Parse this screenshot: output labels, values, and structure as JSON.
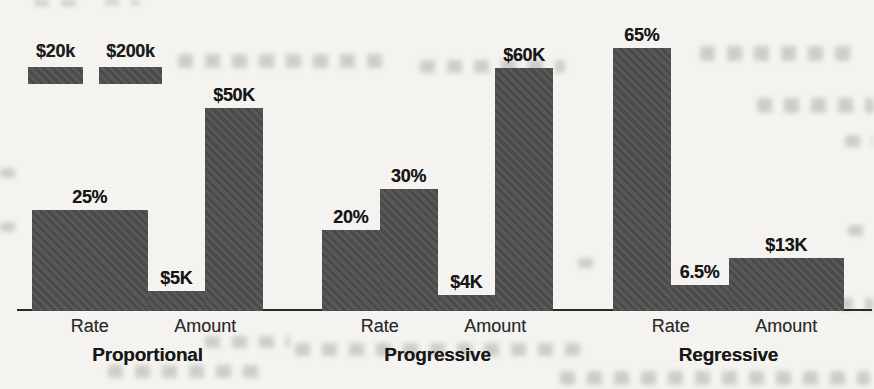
{
  "chart_data": {
    "type": "bar",
    "title": "",
    "xlabel": "",
    "ylabel": "",
    "grid": false,
    "legend": {
      "position": "top-left",
      "entries": [
        {
          "label": "$20k"
        },
        {
          "label": "$200k"
        }
      ]
    },
    "groups": [
      {
        "label": "Proportional",
        "clusters": [
          {
            "label": "Rate",
            "merged": true,
            "bars": [
              {
                "series": "$20k",
                "value": 25,
                "display": "25%"
              },
              {
                "series": "$200k",
                "value": 25,
                "display": "25%"
              }
            ]
          },
          {
            "label": "Amount",
            "merged": false,
            "bars": [
              {
                "series": "$20k",
                "value": 5,
                "display": "$5K"
              },
              {
                "series": "$200k",
                "value": 50,
                "display": "$50K"
              }
            ]
          }
        ]
      },
      {
        "label": "Progressive",
        "clusters": [
          {
            "label": "Rate",
            "merged": false,
            "bars": [
              {
                "series": "$20k",
                "value": 20,
                "display": "20%"
              },
              {
                "series": "$200k",
                "value": 30,
                "display": "30%"
              }
            ]
          },
          {
            "label": "Amount",
            "merged": false,
            "bars": [
              {
                "series": "$20k",
                "value": 4,
                "display": "$4K"
              },
              {
                "series": "$200k",
                "value": 60,
                "display": "$60K"
              }
            ]
          }
        ]
      },
      {
        "label": "Regressive",
        "clusters": [
          {
            "label": "Rate",
            "merged": false,
            "bars": [
              {
                "series": "$20k",
                "value": 65,
                "display": "65%"
              },
              {
                "series": "$200k",
                "value": 6.5,
                "display": "6.5%"
              }
            ]
          },
          {
            "label": "Amount",
            "merged": true,
            "bars": [
              {
                "series": "$20k",
                "value": 13,
                "display": "$13K"
              },
              {
                "series": "$200k",
                "value": 13,
                "display": "$13K"
              }
            ]
          }
        ]
      }
    ],
    "layout": {
      "baseline_y": 309,
      "px_per_unit": 4.05,
      "slot_width": 57.75,
      "group_x": [
        32,
        322,
        613
      ],
      "axis_x1": 17,
      "axis_x2": 872
    },
    "colors": {
      "bar": "#4f4f4f",
      "axis": "#2a2a2a",
      "text": "#1d1d1d",
      "paper": "#f4f3f0"
    }
  }
}
